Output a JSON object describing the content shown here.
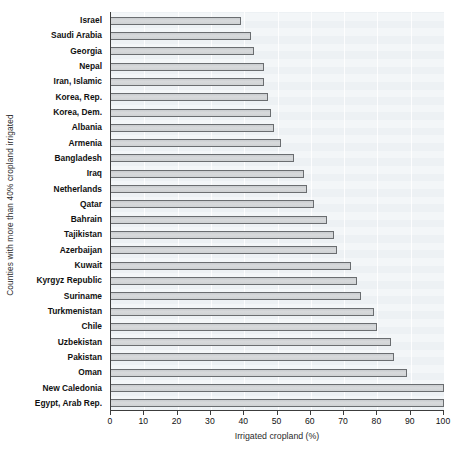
{
  "chart_data": {
    "type": "bar",
    "orientation": "horizontal",
    "title": "",
    "xlabel": "Irrigated cropland (%)",
    "ylabel": "Counties with more than 40% cropland irrigated",
    "xlim": [
      0,
      100
    ],
    "xticks": [
      0,
      10,
      20,
      30,
      40,
      50,
      60,
      70,
      80,
      90,
      100
    ],
    "xtick_labels": [
      "0",
      "10",
      "20",
      "30",
      "40",
      "50",
      "60",
      "70",
      "80",
      "90",
      "100"
    ],
    "grid": "vertical",
    "legend": "none",
    "categories": [
      "Israel",
      "Saudi Arabia",
      "Georgia",
      "Nepal",
      "Iran, Islamic",
      "Korea, Rep.",
      "Korea, Dem.",
      "Albania",
      "Armenia",
      "Bangladesh",
      "Iraq",
      "Netherlands",
      "Qatar",
      "Bahrain",
      "Tajikistan",
      "Azerbaijan",
      "Kuwait",
      "Kyrgyz Republic",
      "Suriname",
      "Turkmenistan",
      "Chile",
      "Uzbekistan",
      "Pakistan",
      "Oman",
      "New Caledonia",
      "Egypt, Arab Rep."
    ],
    "values": [
      39,
      42,
      43,
      46,
      46,
      47,
      48,
      49,
      51,
      55,
      58,
      59,
      61,
      65,
      67,
      68,
      72,
      74,
      75,
      79,
      80,
      84,
      85,
      89,
      100,
      100
    ],
    "colors": {
      "bar_fill": "#d4d7d9",
      "bar_edge": "#6a6d70",
      "panel_background": "#edf1f4",
      "gridline": "#ffffff",
      "axis": "#3c3c3c",
      "text": "#111111"
    }
  }
}
